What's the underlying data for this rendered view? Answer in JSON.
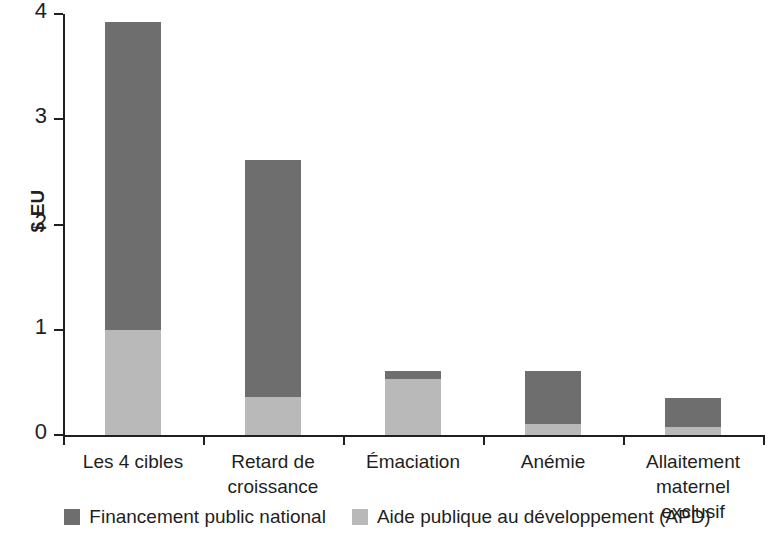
{
  "chart_data": {
    "type": "bar",
    "subtype": "stacked",
    "title": "",
    "xlabel": "",
    "ylabel": "$ EU",
    "ylim": [
      0,
      4
    ],
    "yticks": [
      "0",
      "1",
      "2",
      "3",
      "4"
    ],
    "grid": false,
    "legend_position": "bottom",
    "categories": [
      "Les 4 cibles",
      "Retard de\ncroissance",
      "Émaciation",
      "Anémie",
      "Allaitement\nmaternel exclusif"
    ],
    "series": [
      {
        "name": "Financement public national",
        "color": "#6e6e6e",
        "values": [
          2.92,
          2.25,
          0.08,
          0.51,
          0.27
        ]
      },
      {
        "name": "Aide publique au développement (APD)",
        "color": "#b9b9b9",
        "values": [
          1.0,
          0.36,
          0.53,
          0.1,
          0.08
        ]
      }
    ],
    "totals": [
      3.92,
      2.61,
      0.61,
      0.61,
      0.35
    ]
  },
  "axis": {
    "y_title": "$ EU",
    "y_tick_labels": [
      "4",
      "3",
      "2",
      "1",
      "0"
    ]
  },
  "legend": {
    "items": [
      {
        "label": "Financement public national",
        "color": "#6e6e6e"
      },
      {
        "label": "Aide publique au développement (APD)",
        "color": "#b9b9b9"
      }
    ]
  },
  "colors": {
    "public": "#6e6e6e",
    "apd": "#b9b9b9",
    "axis": "#231f20",
    "background": "#ffffff"
  }
}
